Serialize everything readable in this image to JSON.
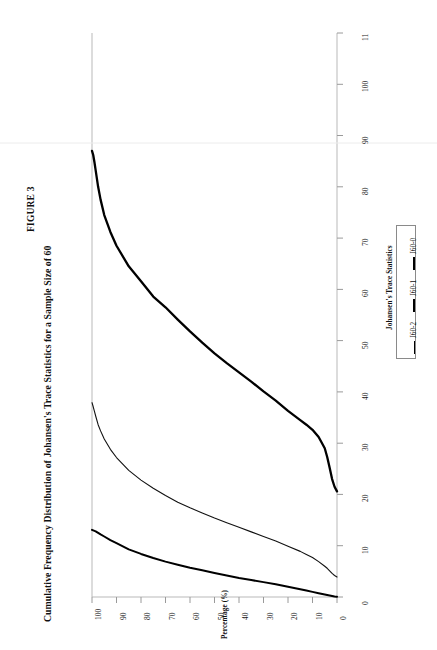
{
  "figure": {
    "number": "FIGURE 3",
    "title": "Cumulative Frequency Distribution of Johansen's Trace Statistics for a Sample Size of 60"
  },
  "axes": {
    "percentage_axis_title": "Percentage (%)",
    "percentage_ticks": [
      "100",
      "90",
      "80",
      "70",
      "60",
      "50",
      "40",
      "30",
      "20",
      "10",
      "0"
    ],
    "trace_axis_title": "Johansen's Trace Statistics",
    "trace_ticks": [
      "0",
      "10",
      "20",
      "30",
      "40",
      "50",
      "60",
      "70",
      "80",
      "90",
      "100",
      "11"
    ]
  },
  "legend": {
    "items": [
      {
        "label": "J60-2",
        "style": "thin"
      },
      {
        "label": "J60-1",
        "style": "med"
      },
      {
        "label": "J60-0",
        "style": "thick"
      }
    ]
  },
  "chart_data": {
    "type": "line",
    "title": "Cumulative Frequency Distribution of Johansen's Trace Statistics for a Sample Size of 60",
    "xlabel": "Percentage (%)",
    "ylabel": "Johansen's Trace Statistics",
    "xlim": [
      0,
      100
    ],
    "ylim": [
      0,
      110
    ],
    "grid": false,
    "legend_position": "right",
    "orientation": "x-axis is Percentage (%) running 100 at left to 0 at right; y-axis is Johansen's Trace Statistics running 0 at bottom to 110 at top",
    "x": [
      0,
      1,
      2,
      3,
      4,
      5,
      7.5,
      10,
      12.5,
      15,
      20,
      25,
      30,
      35,
      40,
      45,
      50,
      55,
      60,
      65,
      70,
      75,
      80,
      85,
      90,
      92.5,
      95,
      96.5,
      97.5,
      98.5,
      99,
      99.5,
      100
    ],
    "series": [
      {
        "name": "J60-0",
        "style": "thick",
        "values": [
          20.6,
          21.5,
          23.0,
          25.2,
          27.3,
          29.0,
          31.2,
          32.6,
          33.6,
          34.5,
          36.3,
          38.3,
          40.1,
          42.0,
          43.8,
          45.6,
          47.5,
          49.6,
          51.8,
          54.1,
          56.5,
          58.6,
          61.6,
          64.5,
          68.5,
          71.2,
          74.5,
          77.5,
          80.0,
          83.2,
          84.8,
          86.2,
          87.0
        ]
      },
      {
        "name": "J60-1",
        "style": "med",
        "values": [
          3.9,
          4.2,
          4.6,
          5.1,
          5.6,
          6.0,
          6.9,
          7.7,
          8.3,
          8.9,
          9.9,
          10.9,
          11.8,
          12.7,
          13.6,
          14.5,
          15.4,
          16.4,
          17.4,
          18.5,
          19.8,
          21.2,
          22.8,
          24.7,
          27.2,
          28.8,
          30.8,
          32.4,
          33.6,
          35.3,
          36.2,
          37.1,
          37.9
        ]
      },
      {
        "name": "J60-2",
        "style": "thin",
        "values": [
          0.05,
          0.1,
          0.2,
          0.3,
          0.4,
          0.5,
          0.75,
          1.0,
          1.25,
          1.5,
          2.0,
          2.5,
          2.9,
          3.3,
          3.7,
          4.2,
          4.7,
          5.2,
          5.7,
          6.3,
          6.9,
          7.6,
          8.4,
          9.3,
          10.5,
          11.1,
          11.8,
          12.2,
          12.5,
          12.8,
          12.9,
          13.0,
          13.1
        ]
      }
    ]
  }
}
